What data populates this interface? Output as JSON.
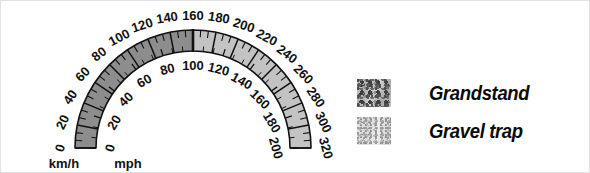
{
  "figure": {
    "background_color": "#ffffff",
    "border_color": "#e2e2e2"
  },
  "gauge": {
    "name": "dual-scale-speedometer-arc",
    "center_x": 192,
    "center_y": 147,
    "outer_radius": 118,
    "inner_radius": 97,
    "start_angle_deg": 180,
    "end_angle_deg": 0,
    "band_stroke_color": "#111111",
    "segment_split_value_kmh": 160,
    "left_segment_color": "#8d8d8d",
    "right_segment_color": "#c3c3c3",
    "outer_scale": {
      "name": "kmh-scale",
      "unit_label": "km/h",
      "min": 0,
      "max": 320,
      "major_step": 20,
      "minor_per_major": 2,
      "tick_labels": [
        "0",
        "20",
        "40",
        "60",
        "80",
        "100",
        "120",
        "140",
        "160",
        "180",
        "200",
        "220",
        "240",
        "260",
        "280",
        "300",
        "320"
      ]
    },
    "inner_scale": {
      "name": "mph-scale",
      "unit_label": "mph",
      "min": 0,
      "max": 200,
      "major_step": 20,
      "minor_per_major": 2,
      "tick_labels": [
        "0",
        "20",
        "40",
        "60",
        "80",
        "100",
        "120",
        "140",
        "160",
        "180",
        "200"
      ]
    }
  },
  "legend": {
    "name": "surface-legend",
    "items": [
      {
        "label": "Grandstand",
        "swatch": "grandstand-texture-swatch",
        "base_color": "#b8b8b8"
      },
      {
        "label": "Gravel trap",
        "swatch": "gravel-texture-swatch",
        "base_color": "#e0e0e0"
      }
    ]
  }
}
